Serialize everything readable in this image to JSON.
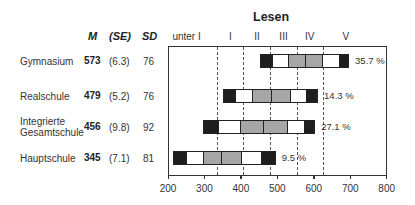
{
  "chart_data": {
    "type": "bar",
    "subtype": "percentile-bands",
    "title": "Lesen",
    "column_headers": {
      "mean": "M",
      "se": "(SE)",
      "sd": "SD"
    },
    "proficiency_levels": [
      "unter I",
      "I",
      "II",
      "III",
      "IV",
      "V"
    ],
    "level_boundaries": [
      335,
      407,
      480,
      553,
      626
    ],
    "x_ticks": [
      200,
      300,
      400,
      500,
      600,
      700,
      800
    ],
    "xlim": [
      200,
      800
    ],
    "percentile_labels": [
      "5",
      "10",
      "25",
      "M",
      "75",
      "90",
      "95"
    ],
    "rows": [
      {
        "school": "Gymnasium",
        "mean": 573,
        "se": "(6.3)",
        "sd": 76,
        "level_v_pct": "35.7 %",
        "percentiles": [
          452,
          485,
          529,
          576,
          622,
          669,
          694
        ]
      },
      {
        "school": "Realschule",
        "mean": 479,
        "se": "(5.2)",
        "sd": 76,
        "level_v_pct": "14.3 %",
        "percentiles": [
          351,
          384,
          430,
          482,
          534,
          578,
          609
        ]
      },
      {
        "school": "Integrierte Gesamtschule",
        "school_lines": [
          "Integrierte",
          "Gesamtschule"
        ],
        "mean": 456,
        "se": "(9.8)",
        "sd": 92,
        "level_v_pct": "27.1 %",
        "percentiles": [
          296,
          337,
          398,
          461,
          527,
          573,
          601
        ]
      },
      {
        "school": "Hauptschule",
        "mean": 345,
        "se": "(7.1)",
        "sd": 81,
        "level_v_pct": "9.5 %",
        "percentiles": [
          214,
          249,
          296,
          345,
          400,
          455,
          493
        ]
      }
    ],
    "colors": {
      "outer": "#1e1e1e",
      "inner": "#ffffff",
      "core": "#a6a6a6"
    },
    "xlabel": "",
    "ylabel": "",
    "grid": false
  }
}
